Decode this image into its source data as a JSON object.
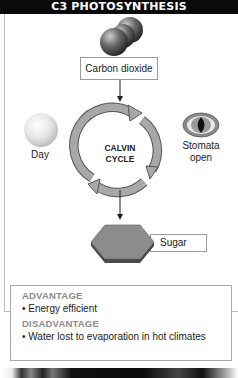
{
  "header": {
    "title": "C3 PHOTOSYNTHESIS"
  },
  "diagram": {
    "input_label": "Carbon dioxide",
    "cycle_label_line1": "CALVIN",
    "cycle_label_line2": "CYCLE",
    "left_condition_label": "Day",
    "right_condition_label_line1": "Stomata",
    "right_condition_label_line2": "open",
    "output_label": "Sugar",
    "icons": {
      "molecule": "co2-molecule-icon",
      "sun": "sun-sphere-icon",
      "stomata": "stomata-eye-icon",
      "cycle": "cycle-arrows-icon",
      "sugar": "hexagon-sugar-icon"
    }
  },
  "info": {
    "advantage_heading": "ADVANTAGE",
    "advantage_items": [
      "• Energy efficient"
    ],
    "disadvantage_heading": "DISADVANTAGE",
    "disadvantage_items": [
      "• Water lost to evaporation in hot climates"
    ]
  },
  "colors": {
    "header_bg": "#0a0a0a",
    "header_text": "#ffffff",
    "heading_gray": "#8a8a8a",
    "cycle_gray": "#9a9a9a",
    "hexagon_gray": "#8c8c8c"
  }
}
